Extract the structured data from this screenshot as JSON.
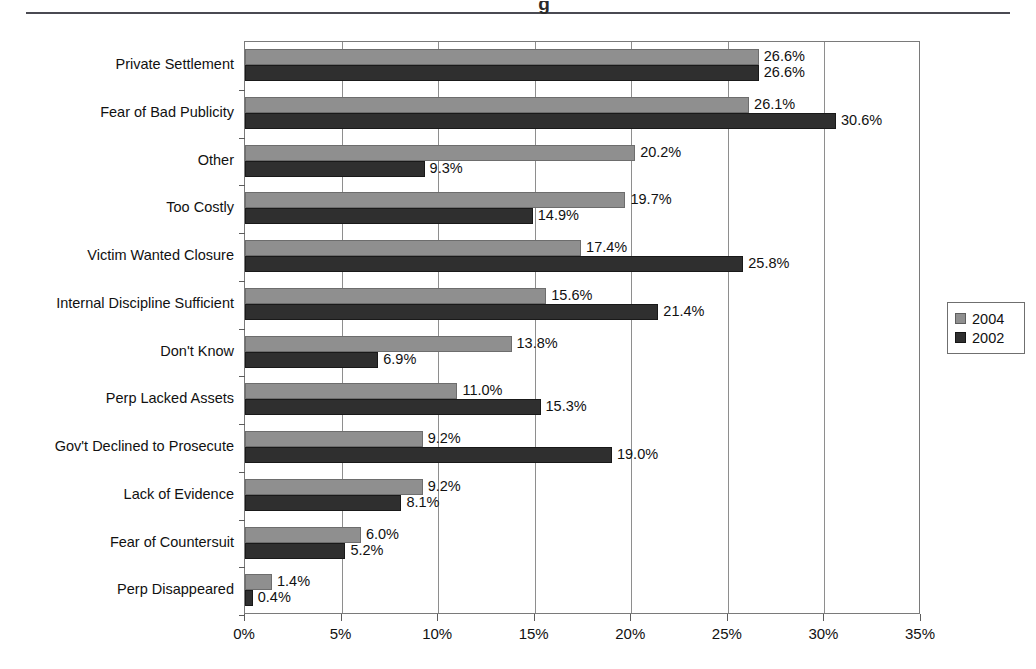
{
  "page": {
    "clipped_title": "g",
    "background": "#ffffff"
  },
  "legend": {
    "position": "right",
    "items": [
      {
        "label": "2004",
        "color": "#8f8f8f"
      },
      {
        "label": "2002",
        "color": "#2f2f2f"
      }
    ]
  },
  "chart_data": {
    "type": "bar",
    "orientation": "horizontal",
    "title": "",
    "xlabel": "",
    "ylabel": "",
    "xlim": [
      0,
      35
    ],
    "xticks": [
      "0%",
      "5%",
      "10%",
      "15%",
      "20%",
      "25%",
      "30%",
      "35%"
    ],
    "xtick_values": [
      0,
      5,
      10,
      15,
      20,
      25,
      30,
      35
    ],
    "grid": true,
    "legend_position": "right",
    "categories": [
      "Private Settlement",
      "Fear of Bad Publicity",
      "Other",
      "Too Costly",
      "Victim Wanted Closure",
      "Internal Discipline Sufficient",
      "Don't Know",
      "Perp Lacked Assets",
      "Gov't Declined to Prosecute",
      "Lack of Evidence",
      "Fear of Countersuit",
      "Perp Disappeared"
    ],
    "series": [
      {
        "name": "2004",
        "color": "#8f8f8f",
        "values": [
          26.6,
          26.1,
          20.2,
          19.7,
          17.4,
          15.6,
          13.8,
          11.0,
          9.2,
          9.2,
          6.0,
          1.4
        ],
        "labels": [
          "26.6%",
          "26.1%",
          "20.2%",
          "19.7%",
          "17.4%",
          "15.6%",
          "13.8%",
          "11.0%",
          "9.2%",
          "9.2%",
          "6.0%",
          "1.4%"
        ]
      },
      {
        "name": "2002",
        "color": "#2f2f2f",
        "values": [
          26.6,
          30.6,
          9.3,
          14.9,
          25.8,
          21.4,
          6.9,
          15.3,
          19.0,
          8.1,
          5.2,
          0.4
        ],
        "labels": [
          "26.6%",
          "30.6%",
          "9.3%",
          "14.9%",
          "25.8%",
          "21.4%",
          "6.9%",
          "15.3%",
          "19.0%",
          "8.1%",
          "5.2%",
          "0.4%"
        ]
      }
    ]
  }
}
